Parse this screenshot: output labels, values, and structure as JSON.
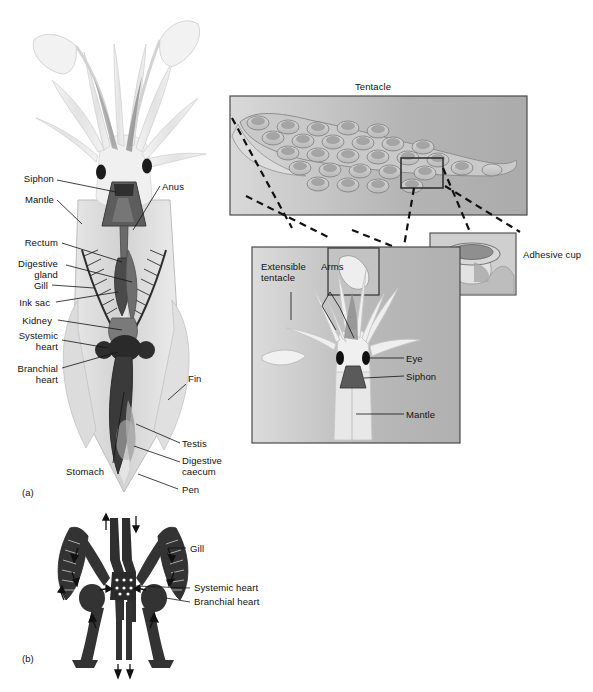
{
  "figure": {
    "background_color": "#ffffff",
    "ink_color": "#111111"
  },
  "panels": [
    {
      "id": "a",
      "marker": "(a)",
      "caption": "Internal anatomy of a squid"
    },
    {
      "id": "b",
      "marker": "(b)",
      "caption": "Circulatory system schematic"
    }
  ],
  "panel_a": {
    "labels_left": [
      {
        "name": "siphon",
        "text": "Siphon"
      },
      {
        "name": "mantle",
        "text": "Mantle"
      },
      {
        "name": "rectum",
        "text": "Rectum"
      },
      {
        "name": "digestive-gland",
        "text": "Digestive\ngland"
      },
      {
        "name": "gill",
        "text": "Gill"
      },
      {
        "name": "ink-sac",
        "text": "Ink sac"
      },
      {
        "name": "kidney",
        "text": "Kidney"
      },
      {
        "name": "systemic-heart",
        "text": "Systemic\nheart"
      },
      {
        "name": "branchial-heart",
        "text": "Branchial\nheart"
      },
      {
        "name": "stomach",
        "text": "Stomach"
      }
    ],
    "labels_right": [
      {
        "name": "anus",
        "text": "Anus"
      },
      {
        "name": "fin",
        "text": "Fin"
      },
      {
        "name": "testis",
        "text": "Testis"
      },
      {
        "name": "digestive-caecum",
        "text": "Digestive\ncaecum"
      },
      {
        "name": "pen",
        "text": "Pen"
      }
    ]
  },
  "inset_tentacle": {
    "title": "Tentacle",
    "sucker_rows": [
      5,
      6,
      6,
      6,
      5
    ],
    "callout_label": "Adhesive cup"
  },
  "inset_head": {
    "labels": [
      {
        "name": "extensible-tentacle",
        "text": "Extensible\ntentacle"
      },
      {
        "name": "arms",
        "text": "Arms"
      },
      {
        "name": "eye",
        "text": "Eye"
      },
      {
        "name": "siphon",
        "text": "Siphon"
      },
      {
        "name": "mantle",
        "text": "Mantle"
      }
    ]
  },
  "panel_b": {
    "labels": [
      {
        "name": "gill",
        "text": "Gill"
      },
      {
        "name": "systemic-heart",
        "text": "Systemic heart"
      },
      {
        "name": "branchial-heart",
        "text": "Branchial heart"
      }
    ]
  },
  "colors": {
    "body_pale": "#ededed",
    "body_mid": "#cfcfcf",
    "organ_dark": "#3a3a3a",
    "organ_mid": "#6f6f6f",
    "inset_bg_light": "#d6d6d6",
    "inset_bg_mid": "#b6b6b6",
    "line": "#111111"
  }
}
